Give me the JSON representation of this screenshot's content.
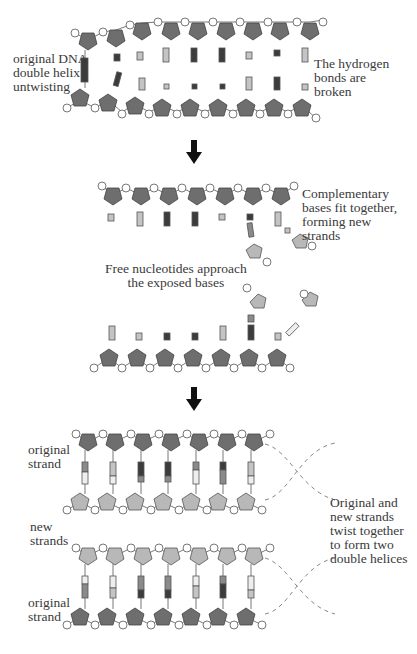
{
  "colors": {
    "dark_sugar": "#6e6e6e",
    "light_sugar": "#b8b8b8",
    "phosphate_fill": "#ffffff",
    "base_dark": "#3c3c3c",
    "base_mid": "#8a8a8a",
    "base_light": "#c4c4c4",
    "base_white": "#eeeeee",
    "arrow": "#111111",
    "dashed": "#888888"
  },
  "labels": {
    "untwisting": "original DNA\ndouble helix\nuntwisting",
    "hydrogen_bonds": "The hydrogen\nbonds are\nbroken",
    "complementary": "Complementary\nbases fit together,\nforming new\nstrands",
    "free_nucleotides": "Free nucleotides approach\nthe exposed bases",
    "original_strand_top": "original\nstrand",
    "new_strands": "new\nstrands",
    "original_strand_bottom": "original\nstrand",
    "twist_together": "Original and\nnew strands\ntwist together\nto form two\ndouble helices"
  },
  "stages": [
    {
      "name": "untwisting",
      "nucleotides_per_strand": 9
    },
    {
      "name": "separated-strands",
      "nucleotides_per_strand": 7
    },
    {
      "name": "two-double-helices",
      "nucleotides_per_strand": 7
    }
  ]
}
